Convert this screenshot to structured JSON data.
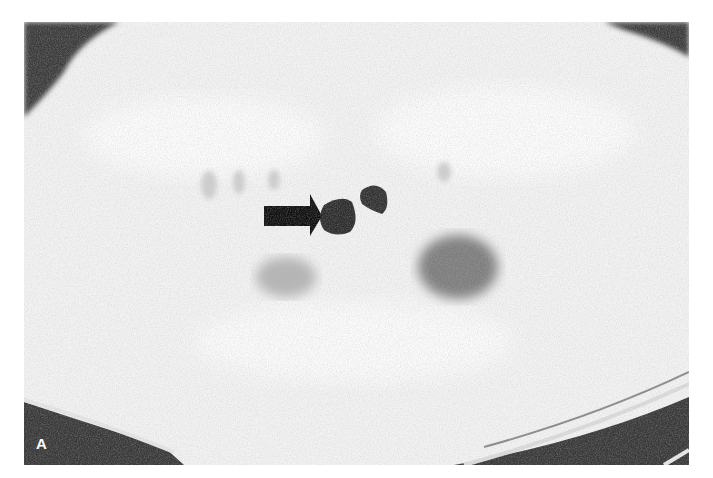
{
  "figure": {
    "panel_label": "A",
    "annotation": {
      "type": "arrow",
      "direction": "right",
      "color": "#111111"
    },
    "colors": {
      "background": "#ffffff",
      "tissue": "#f4f4f4",
      "air": "#3a3a3a",
      "arrow": "#111111"
    }
  }
}
